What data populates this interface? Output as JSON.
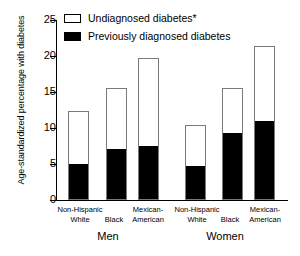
{
  "chart_data": {
    "type": "bar",
    "title": "",
    "subtype": "stacked",
    "xlabel": "",
    "ylabel": "Age-standardized percentage with diabetes",
    "ylim": [
      0,
      25
    ],
    "yticks": [
      0,
      5,
      10,
      15,
      20,
      25
    ],
    "grid": false,
    "legend_position": "top-left",
    "groups": [
      "Men",
      "Women"
    ],
    "categories": [
      "Non-Hispanic White",
      "Black",
      "Mexican-American",
      "Non-Hispanic White",
      "Black",
      "Mexican-American"
    ],
    "category_lines": [
      [
        "Non-Hispanic",
        "White"
      ],
      [
        "",
        "Black"
      ],
      [
        "Mexican-",
        "American"
      ],
      [
        "Non-Hispanic",
        "White"
      ],
      [
        "",
        "Black"
      ],
      [
        "Mexican-",
        "American"
      ]
    ],
    "series": [
      {
        "name": "Previously diagnosed diabetes",
        "color": "#000000",
        "values": [
          4.9,
          6.9,
          7.3,
          4.6,
          9.1,
          10.9
        ]
      },
      {
        "name": "Undiagnosed diabetes*",
        "color": "#ffffff",
        "values": [
          7.4,
          8.7,
          12.4,
          5.8,
          6.4,
          10.5
        ]
      }
    ],
    "totals": [
      12.3,
      15.6,
      19.7,
      10.4,
      15.5,
      21.4
    ],
    "footnote": "*"
  },
  "legend": {
    "items": [
      {
        "label": "Undiagnosed diabetes*",
        "style": "open"
      },
      {
        "label": "Previously diagnosed diabetes",
        "style": "filled"
      }
    ]
  },
  "axis": {
    "y_title": "Age-standardized percentage with diabetes",
    "y_tick_labels": [
      "0",
      "5",
      "10",
      "15",
      "20",
      "25"
    ]
  },
  "groups": [
    {
      "label": "Men"
    },
    {
      "label": "Women"
    }
  ]
}
